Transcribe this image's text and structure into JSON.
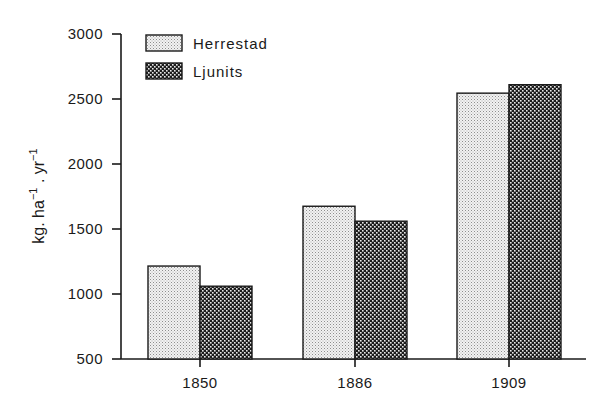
{
  "chart_data": {
    "type": "bar",
    "title": "",
    "xlabel": "",
    "ylabel": "kg. ha-1 . yr-1",
    "ylabel_parts": {
      "a": "kg. ha",
      "a_sup": "−1",
      "b": " . yr",
      "b_sup": "−1"
    },
    "categories": [
      "1850",
      "1886",
      "1909"
    ],
    "series": [
      {
        "name": "Herrestad",
        "pattern": "light-stipple",
        "values": [
          1215,
          1675,
          2545
        ]
      },
      {
        "name": "Ljunits",
        "pattern": "dark-checker",
        "values": [
          1060,
          1560,
          2610
        ]
      }
    ],
    "ylim": [
      500,
      3000
    ],
    "yticks": [
      500,
      1000,
      1500,
      2000,
      2500,
      3000
    ],
    "grid": false,
    "legend_position": "top-left"
  },
  "legend": {
    "items": [
      {
        "label": "Herrestad"
      },
      {
        "label": "Ljunits"
      }
    ]
  },
  "colors": {
    "axis": "#1a1a1a",
    "light_fill_bg": "#f2f2f2",
    "light_fill_dot": "#9a9a9a",
    "dark_fill_bg": "#1c1c1c",
    "dark_fill_dot": "#e6e6e6"
  }
}
